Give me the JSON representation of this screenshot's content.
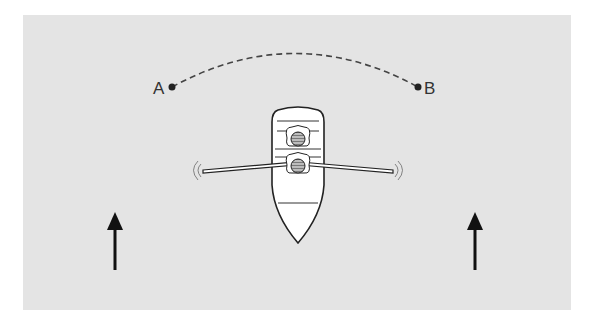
{
  "diagram": {
    "type": "rowing-boat-crossing-current",
    "colors": {
      "background": "#e4e4e4",
      "page": "#ffffff",
      "ink": "#222222",
      "boat_fill": "#ffffff",
      "path": "#444444"
    },
    "points": [
      {
        "id": "A",
        "label": "A",
        "x": 172,
        "y": 87
      },
      {
        "id": "B",
        "label": "B",
        "x": 418,
        "y": 87
      }
    ],
    "path": {
      "from": "A",
      "to": "B",
      "style": "dashed",
      "shape": "arc"
    },
    "boat": {
      "heading": "up",
      "rowers": 2,
      "oars": 2
    },
    "current_arrows": [
      {
        "x": 115,
        "direction": "up"
      },
      {
        "x": 475,
        "direction": "up"
      }
    ]
  }
}
